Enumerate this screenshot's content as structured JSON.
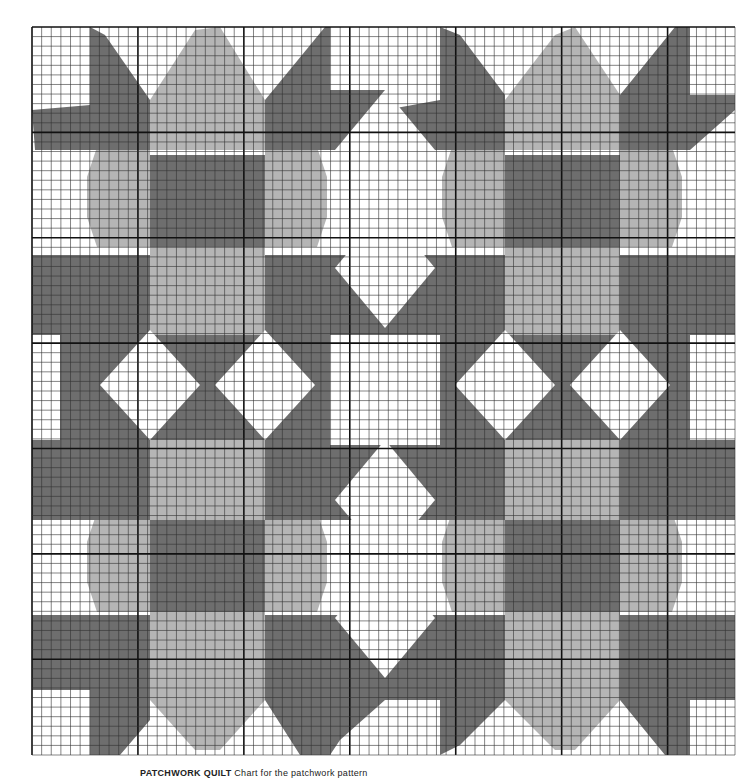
{
  "chart_title": "Patchwork star pattern chart on graph paper",
  "caption": {
    "label": "PATCHWORK QUILT",
    "text": "Chart for the patchwork pattern"
  },
  "grid": {
    "origin_x": 32,
    "origin_y": 27,
    "width": 703,
    "height": 728,
    "cell": 9.6,
    "major_every": 11
  },
  "colors": {
    "background": "#ffffff",
    "dark": "#6e6e6e",
    "light": "#b5b5b5",
    "white": "#ffffff",
    "grid_minor": "#333333",
    "grid_major": "#111111"
  },
  "legend": [
    {
      "name": "dark-shade",
      "color": "#6e6e6e"
    },
    {
      "name": "light-shade",
      "color": "#b5b5b5"
    },
    {
      "name": "background",
      "color": "#ffffff"
    }
  ]
}
